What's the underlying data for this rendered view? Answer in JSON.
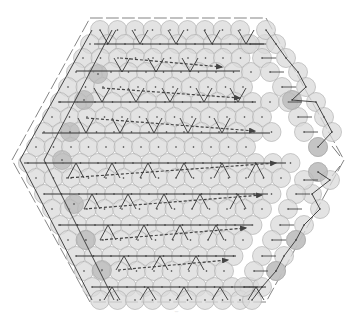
{
  "diagram": {
    "caption": "—",
    "colors": {
      "background": "#ffffff",
      "circle_fill": "#d9d9d9",
      "circle_fill_dark": "#b9b9b9",
      "circle_stroke": "#a8a8a8",
      "path": "#333333",
      "hex_edge": "#777777",
      "arrow": "#444444"
    },
    "hexagon": {
      "vertices": [
        [
          90,
          18
        ],
        [
          266,
          18
        ],
        [
          344,
          160
        ],
        [
          266,
          302
        ],
        [
          90,
          302
        ],
        [
          12,
          160
        ]
      ]
    },
    "circle_radius": 9.5,
    "circle_rows": [
      {
        "y": 30,
        "x_start": 100,
        "x_end": 256,
        "step": 17.5
      },
      {
        "y": 44,
        "x_start": 90,
        "x_end": 265,
        "step": 17.5
      },
      {
        "y": 58,
        "x_start": 83,
        "x_end": 244,
        "step": 17.5
      },
      {
        "y": 72,
        "x_start": 76,
        "x_end": 262,
        "step": 17.5
      },
      {
        "y": 87,
        "x_start": 68,
        "x_end": 256,
        "step": 17.5
      },
      {
        "y": 102,
        "x_start": 60,
        "x_end": 273,
        "step": 17.5
      },
      {
        "y": 117,
        "x_start": 52,
        "x_end": 262,
        "step": 17.5
      },
      {
        "y": 132,
        "x_start": 44,
        "x_end": 282,
        "step": 17.5
      },
      {
        "y": 147,
        "x_start": 36,
        "x_end": 260,
        "step": 17.5
      },
      {
        "y": 163,
        "x_start": 28,
        "x_end": 302,
        "step": 17.5
      },
      {
        "y": 178,
        "x_start": 36,
        "x_end": 290,
        "step": 17.5
      },
      {
        "y": 194,
        "x_start": 44,
        "x_end": 284,
        "step": 17.5
      },
      {
        "y": 209,
        "x_start": 52,
        "x_end": 270,
        "step": 17.5
      },
      {
        "y": 225,
        "x_start": 60,
        "x_end": 266,
        "step": 17.5
      },
      {
        "y": 240,
        "x_start": 68,
        "x_end": 252,
        "step": 17.5
      },
      {
        "y": 256,
        "x_start": 76,
        "x_end": 236,
        "step": 17.5
      },
      {
        "y": 271,
        "x_start": 84,
        "x_end": 230,
        "step": 17.5
      },
      {
        "y": 287,
        "x_start": 92,
        "x_end": 256,
        "step": 17.5
      },
      {
        "y": 300,
        "x_start": 100,
        "x_end": 248,
        "step": 17.5
      }
    ],
    "right_band": {
      "upper": [
        [
          266,
          30
        ],
        [
          276,
          44
        ],
        [
          286,
          58
        ],
        [
          298,
          72
        ],
        [
          306,
          87
        ],
        [
          292,
          100
        ],
        [
          316,
          102
        ],
        [
          324,
          117
        ],
        [
          332,
          132
        ],
        [
          318,
          147
        ]
      ],
      "lower": [
        [
          318,
          172
        ],
        [
          330,
          180
        ],
        [
          312,
          194
        ],
        [
          320,
          209
        ],
        [
          304,
          225
        ],
        [
          296,
          240
        ],
        [
          284,
          256
        ],
        [
          276,
          271
        ],
        [
          262,
          287
        ],
        [
          252,
          300
        ]
      ],
      "inner_upper": [
        [
          250,
          44
        ],
        [
          262,
          58
        ],
        [
          270,
          72
        ],
        [
          282,
          87
        ],
        [
          288,
          102
        ],
        [
          298,
          117
        ],
        [
          304,
          132
        ]
      ],
      "inner_lower": [
        [
          304,
          180
        ],
        [
          296,
          194
        ],
        [
          288,
          209
        ],
        [
          280,
          225
        ],
        [
          272,
          240
        ],
        [
          262,
          256
        ],
        [
          254,
          271
        ],
        [
          244,
          287
        ]
      ]
    },
    "dark_circles": [
      [
        292,
        100
      ],
      [
        318,
        147
      ],
      [
        318,
        172
      ],
      [
        296,
        240
      ],
      [
        276,
        271
      ],
      [
        98,
        74
      ],
      [
        84,
        100
      ],
      [
        70,
        132
      ],
      [
        62,
        160
      ],
      [
        74,
        204
      ],
      [
        86,
        240
      ],
      [
        102,
        270
      ]
    ],
    "solid_paths": [
      {
        "y": 44,
        "x1": 94,
        "x2": 264
      },
      {
        "y": 71,
        "x1": 76,
        "x2": 240
      },
      {
        "y": 102,
        "x1": 58,
        "x2": 256
      },
      {
        "y": 133,
        "x1": 42,
        "x2": 270
      },
      {
        "y": 163,
        "x1": 24,
        "x2": 286
      },
      {
        "y": 194,
        "x1": 44,
        "x2": 268
      },
      {
        "y": 225,
        "x1": 58,
        "x2": 252
      },
      {
        "y": 256,
        "x1": 76,
        "x2": 236
      },
      {
        "y": 287,
        "x1": 92,
        "x2": 266
      }
    ],
    "dashed_arrows": [
      {
        "x1": 120,
        "y1": 58,
        "x2": 222,
        "y2": 67
      },
      {
        "x1": 102,
        "y1": 88,
        "x2": 240,
        "y2": 98
      },
      {
        "x1": 86,
        "y1": 118,
        "x2": 255,
        "y2": 131
      },
      {
        "x1": 66,
        "y1": 178,
        "x2": 276,
        "y2": 163
      },
      {
        "x1": 84,
        "y1": 209,
        "x2": 262,
        "y2": 195
      },
      {
        "x1": 100,
        "y1": 240,
        "x2": 246,
        "y2": 228
      },
      {
        "x1": 118,
        "y1": 270,
        "x2": 228,
        "y2": 260
      }
    ],
    "zigzag_down": [
      {
        "y_top": 58,
        "y_bot": 72,
        "xs": [
          122,
          156,
          190
        ]
      },
      {
        "y_top": 88,
        "y_bot": 102,
        "xs": [
          102,
          136,
          170,
          204,
          238
        ]
      },
      {
        "y_top": 118,
        "y_bot": 133,
        "xs": [
          86,
          120,
          154,
          188,
          222
        ]
      }
    ],
    "zigzag_up": [
      {
        "y_top": 163,
        "y_bot": 178,
        "xs": [
          76,
          112,
          148,
          184,
          222,
          256
        ]
      },
      {
        "y_top": 194,
        "y_bot": 209,
        "xs": [
          92,
          128,
          164,
          200,
          238
        ]
      },
      {
        "y_top": 225,
        "y_bot": 240,
        "xs": [
          108,
          144,
          180,
          216
        ]
      },
      {
        "y_top": 256,
        "y_bot": 270,
        "xs": [
          124,
          160,
          196
        ]
      }
    ],
    "top_ticks": {
      "y_top": 30,
      "y_bot": 44,
      "xs": [
        108,
        140,
        176,
        212,
        246
      ]
    },
    "bottom_ticks": {
      "y_top": 287,
      "y_bot": 300,
      "xs": [
        112,
        148,
        184,
        220,
        256
      ]
    },
    "left_diagonals": [
      [
        [
          92,
          30
        ],
        [
          20,
          160
        ],
        [
          92,
          300
        ]
      ],
      [
        [
          112,
          30
        ],
        [
          44,
          160
        ],
        [
          114,
          300
        ]
      ]
    ],
    "outer_right_marks": [
      [
        [
          332,
          146
        ],
        [
          340,
          156
        ]
      ],
      [
        [
          340,
          166
        ],
        [
          332,
          176
        ]
      ]
    ]
  }
}
